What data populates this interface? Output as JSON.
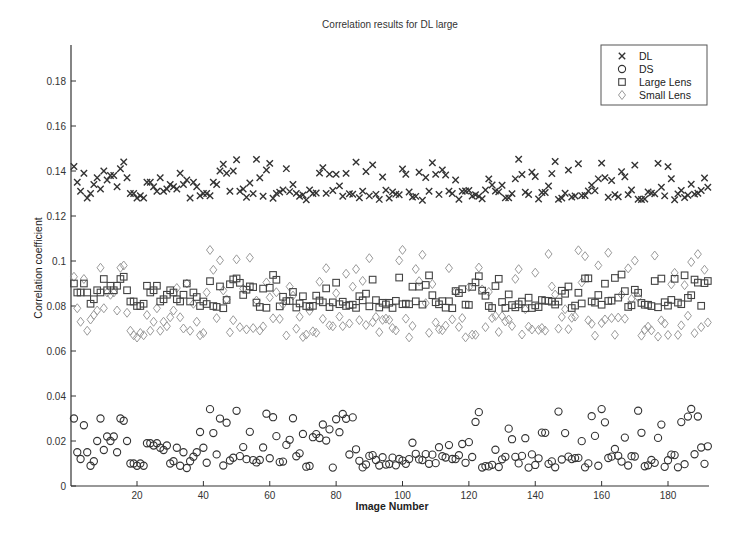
{
  "chart_data": {
    "type": "scatter",
    "title": "Correlation results for DL large",
    "xlabel": "Image Number",
    "ylabel": "Correlation coefficient",
    "xlim": [
      0,
      193
    ],
    "ylim": [
      0,
      0.195
    ],
    "xticks": [
      20,
      40,
      60,
      80,
      100,
      120,
      140,
      160,
      180
    ],
    "yticks": [
      0,
      0.02,
      0.04,
      0.06,
      0.08,
      0.1,
      0.12,
      0.14,
      0.16,
      0.18
    ],
    "ytick_labels": [
      "0",
      "0.02",
      "0.04",
      "0.06",
      "0.08",
      "0.1",
      "0.12",
      "0.14",
      "0.16",
      "0.18"
    ],
    "grid": false,
    "legend_position": "upper right",
    "n_points": 192,
    "series": [
      {
        "name": "DL",
        "marker": "x",
        "color": "#333333",
        "typical_range": [
          0.127,
          0.146
        ],
        "mean": 0.134,
        "sample_values": [
          0.142,
          0.135,
          0.131,
          0.139,
          0.128,
          0.13,
          0.134,
          0.137,
          0.132,
          0.14,
          0.136,
          0.138,
          0.138,
          0.133,
          0.141,
          0.144,
          0.137,
          0.13,
          0.13,
          0.128,
          0.129,
          0.128,
          0.135,
          0.135,
          0.133,
          0.131,
          0.137,
          0.131,
          0.132,
          0.134,
          0.133,
          0.132,
          0.139,
          0.134,
          0.136,
          0.128,
          0.135,
          0.133,
          0.129,
          0.13,
          0.13,
          0.129,
          0.135,
          0.134,
          0.14,
          0.143,
          0.139,
          0.131,
          0.14,
          0.145,
          0.131,
          0.132
        ]
      },
      {
        "name": "DS",
        "marker": "o",
        "color": "#333333",
        "typical_range": [
          0.008,
          0.035
        ],
        "mean": 0.016,
        "sample_values": [
          0.03,
          0.015,
          0.012,
          0.027,
          0.015,
          0.009,
          0.011,
          0.02,
          0.03,
          0.016,
          0.022,
          0.02,
          0.022,
          0.015,
          0.03,
          0.029,
          0.02,
          0.01,
          0.01,
          0.009,
          0.01,
          0.009,
          0.019,
          0.019,
          0.018,
          0.019,
          0.017,
          0.016,
          0.018,
          0.01,
          0.011,
          0.017,
          0.009,
          0.015,
          0.008,
          0.011,
          0.013,
          0.015,
          0.024,
          0.017
        ]
      },
      {
        "name": "Large Lens",
        "marker": "square",
        "color": "#444444",
        "typical_range": [
          0.079,
          0.094
        ],
        "mean": 0.085,
        "sample_values": [
          0.09,
          0.086,
          0.086,
          0.09,
          0.086,
          0.081,
          0.083,
          0.087,
          0.086,
          0.092,
          0.087,
          0.089,
          0.087,
          0.089,
          0.092,
          0.093,
          0.087,
          0.082,
          0.082,
          0.08,
          0.08,
          0.081,
          0.089,
          0.086,
          0.087,
          0.089,
          0.082,
          0.083,
          0.085,
          0.087,
          0.086,
          0.083,
          0.082,
          0.085,
          0.09,
          0.082,
          0.086,
          0.084,
          0.08,
          0.082
        ]
      },
      {
        "name": "Small Lens",
        "marker": "diamond",
        "color": "#999999",
        "typical_range": [
          0.066,
          0.105
        ],
        "mean": 0.076,
        "sample_values": [
          0.093,
          0.079,
          0.073,
          0.092,
          0.069,
          0.074,
          0.076,
          0.078,
          0.097,
          0.079,
          0.086,
          0.085,
          0.086,
          0.078,
          0.097,
          0.098,
          0.077,
          0.069,
          0.067,
          0.066,
          0.068,
          0.067,
          0.076,
          0.069,
          0.073,
          0.079,
          0.069,
          0.073,
          0.071,
          0.075,
          0.078,
          0.088,
          0.075,
          0.07,
          0.09,
          0.069,
          0.081,
          0.073,
          0.067,
          0.068
        ]
      }
    ]
  },
  "legend": {
    "items": [
      {
        "label": "DL",
        "marker": "x"
      },
      {
        "label": "DS",
        "marker": "o"
      },
      {
        "label": "Large Lens",
        "marker": "square"
      },
      {
        "label": "Small Lens",
        "marker": "diamond"
      }
    ]
  }
}
